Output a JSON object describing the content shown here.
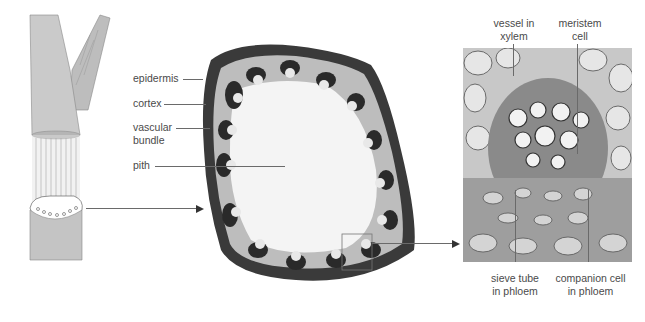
{
  "figure": {
    "panels": [
      {
        "id": "stem",
        "description": "herbaceous dicot stem with cut-away showing vascular bundle ring"
      },
      {
        "id": "cross-section",
        "description": "transverse section of stem"
      },
      {
        "id": "micrograph",
        "description": "magnified vascular bundle"
      }
    ]
  },
  "labels": {
    "cross_section": {
      "epidermis": "epidermis",
      "cortex": "cortex",
      "vascular_bundle_line1": "vascular",
      "vascular_bundle_line2": "bundle",
      "pith": "pith"
    },
    "micrograph": {
      "vessel_line1": "vessel in",
      "vessel_line2": "xylem",
      "meristem_line1": "meristem",
      "meristem_line2": "cell",
      "sieve_line1": "sieve tube",
      "sieve_line2": "in phloem",
      "companion_line1": "companion cell",
      "companion_line2": "in phloem"
    }
  },
  "colors": {
    "stem": "#c9c9c9",
    "stem_dark": "#9a9a9a",
    "tissue_dark": "#2a2a2a",
    "pith": "#f4f4f4",
    "leader_line": "#6a6a6a"
  }
}
